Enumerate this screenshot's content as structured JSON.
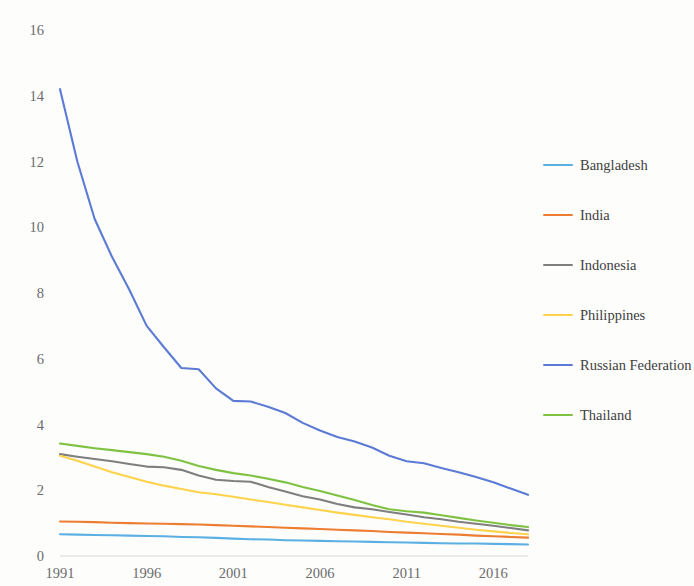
{
  "chart_data": {
    "type": "line",
    "title": "",
    "subtitle": "",
    "xlabel": "",
    "ylabel": "",
    "xlim": [
      1991,
      2018
    ],
    "ylim": [
      0,
      16
    ],
    "ytick_values": [
      0,
      2,
      4,
      6,
      8,
      10,
      12,
      14,
      16
    ],
    "ytick_labels": [
      "0",
      "2",
      "4",
      "6",
      "8",
      "10",
      "12",
      "14",
      "16"
    ],
    "xtick_values": [
      1991,
      1996,
      2001,
      2006,
      2011,
      2016
    ],
    "xtick_labels": [
      "1991",
      "1996",
      "2001",
      "2006",
      "2011",
      "2016"
    ],
    "grid": false,
    "legend_position": "right",
    "x": [
      1991,
      1992,
      1993,
      1994,
      1995,
      1996,
      1997,
      1998,
      1999,
      2000,
      2001,
      2002,
      2003,
      2004,
      2005,
      2006,
      2007,
      2008,
      2009,
      2010,
      2011,
      2012,
      2013,
      2014,
      2015,
      2016,
      2017,
      2018
    ],
    "series": [
      {
        "name": "Bangladesh",
        "color": "#5BB0E3",
        "values": [
          0.66,
          0.65,
          0.64,
          0.63,
          0.62,
          0.61,
          0.6,
          0.58,
          0.57,
          0.55,
          0.53,
          0.51,
          0.5,
          0.48,
          0.47,
          0.46,
          0.45,
          0.44,
          0.43,
          0.42,
          0.41,
          0.4,
          0.39,
          0.38,
          0.38,
          0.37,
          0.36,
          0.35
        ]
      },
      {
        "name": "India",
        "color": "#ED7D31",
        "values": [
          1.05,
          1.04,
          1.03,
          1.01,
          1.0,
          0.99,
          0.98,
          0.97,
          0.96,
          0.94,
          0.92,
          0.9,
          0.88,
          0.86,
          0.84,
          0.82,
          0.8,
          0.78,
          0.76,
          0.73,
          0.71,
          0.69,
          0.67,
          0.65,
          0.62,
          0.6,
          0.58,
          0.56
        ]
      },
      {
        "name": "Indonesia",
        "color": "#7F7F7F",
        "values": [
          3.1,
          3.02,
          2.95,
          2.88,
          2.8,
          2.72,
          2.7,
          2.62,
          2.45,
          2.32,
          2.28,
          2.26,
          2.1,
          1.96,
          1.82,
          1.72,
          1.58,
          1.48,
          1.42,
          1.34,
          1.26,
          1.18,
          1.12,
          1.04,
          0.98,
          0.92,
          0.85,
          0.78
        ]
      },
      {
        "name": "Philippines",
        "color": "#FFD24C",
        "values": [
          3.05,
          2.9,
          2.72,
          2.55,
          2.4,
          2.26,
          2.14,
          2.04,
          1.94,
          1.88,
          1.8,
          1.72,
          1.64,
          1.56,
          1.48,
          1.4,
          1.32,
          1.25,
          1.18,
          1.12,
          1.04,
          0.98,
          0.92,
          0.86,
          0.8,
          0.75,
          0.7,
          0.66
        ]
      },
      {
        "name": "Russian Federation",
        "color": "#5B7BD5",
        "values": [
          14.2,
          12.0,
          10.25,
          9.1,
          8.1,
          7.0,
          6.35,
          5.72,
          5.68,
          5.1,
          4.72,
          4.7,
          4.54,
          4.35,
          4.05,
          3.82,
          3.62,
          3.48,
          3.3,
          3.05,
          2.88,
          2.82,
          2.68,
          2.55,
          2.4,
          2.24,
          2.05,
          1.86
        ]
      },
      {
        "name": "Thailand",
        "color": "#7FC242",
        "values": [
          3.42,
          3.35,
          3.28,
          3.22,
          3.16,
          3.1,
          3.02,
          2.9,
          2.74,
          2.62,
          2.52,
          2.45,
          2.35,
          2.24,
          2.1,
          1.98,
          1.84,
          1.7,
          1.55,
          1.42,
          1.36,
          1.32,
          1.24,
          1.16,
          1.08,
          1.01,
          0.94,
          0.88
        ]
      }
    ]
  },
  "legend": {
    "items": [
      {
        "label": "Bangladesh"
      },
      {
        "label": "India"
      },
      {
        "label": "Indonesia"
      },
      {
        "label": "Philippines"
      },
      {
        "label": "Russian Federation"
      },
      {
        "label": "Thailand"
      }
    ]
  }
}
